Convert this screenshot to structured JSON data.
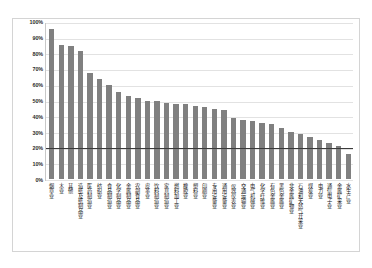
{
  "chart_data": {
    "type": "bar",
    "title": "",
    "xlabel": "",
    "ylabel": "",
    "ylim": [
      0,
      100
    ],
    "ytick_labels": [
      "100%",
      "90%",
      "80%",
      "70%",
      "60%",
      "50%",
      "40%",
      "30%",
      "20%",
      "10%",
      "0%"
    ],
    "ytick_values": [
      100,
      90,
      80,
      70,
      60,
      50,
      40,
      30,
      20,
      10,
      0
    ],
    "grid": true,
    "legend": "none",
    "bar_color": "#808080",
    "reference_line": {
      "value": 20,
      "label": "20%",
      "color": "#3a3a3a",
      "orientation": "horizontal"
    },
    "categories": [
      "烟草业",
      "木业",
      "其他",
      "造纸及纸制品业",
      "医药制造业",
      "纺织业",
      "食品制造业",
      "化学制品业",
      "金属制品业",
      "农副食品业",
      "皮革业",
      "饮料制造业",
      "家具制造业",
      "燃料加工业",
      "橡胶业",
      "塑料业",
      "印刷业",
      "专用设备业",
      "通用设备业",
      "仪器仪表业",
      "交通运输业",
      "电气机械业",
      "化学纤维业",
      "有色金属业",
      "黑色金属业",
      "非金属矿物业",
      "石油和天然气开采业",
      "煤炭业",
      "电力业",
      "通信电子业",
      "金属矿采业",
      "水生产业"
    ],
    "values": [
      96,
      86,
      85,
      82,
      68,
      64,
      60,
      56,
      53,
      52,
      50,
      50,
      49,
      48,
      48,
      47,
      46,
      45,
      44,
      39,
      38,
      37,
      36,
      35,
      33,
      30,
      29,
      27,
      25,
      23,
      21,
      16
    ]
  }
}
